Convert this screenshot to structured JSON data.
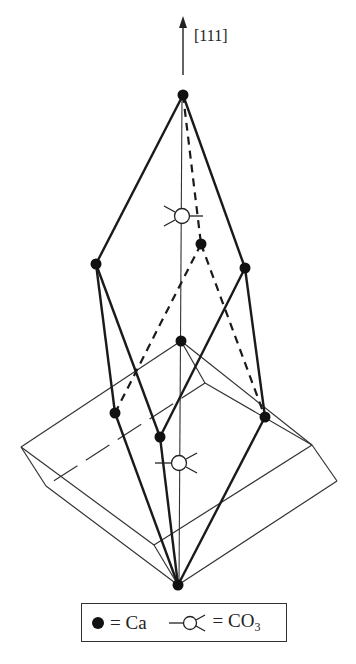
{
  "axis": {
    "label": "[111]"
  },
  "legend": {
    "ca_label": "= Ca",
    "co3_label_main": "= CO",
    "co3_label_sub": "3"
  },
  "symbols": {
    "ca": "filled-circle",
    "co3": "open-circle-with-three-arms"
  },
  "colors": {
    "line": "#222222",
    "thin_line": "#333333",
    "background": "#ffffff"
  },
  "ca_atoms": [
    {
      "id": "A",
      "x": 183,
      "y": 95
    },
    {
      "id": "B",
      "x": 96,
      "y": 264
    },
    {
      "id": "C",
      "x": 245,
      "y": 268
    },
    {
      "id": "D",
      "x": 201,
      "y": 244
    },
    {
      "id": "E",
      "x": 181,
      "y": 341
    },
    {
      "id": "F",
      "x": 115,
      "y": 413
    },
    {
      "id": "G",
      "x": 160,
      "y": 437
    },
    {
      "id": "H",
      "x": 265,
      "y": 417
    },
    {
      "id": "I",
      "x": 178,
      "y": 585
    }
  ],
  "co3_groups": [
    {
      "id": "upper",
      "x": 182,
      "y": 216
    },
    {
      "id": "lower",
      "x": 179,
      "y": 463
    }
  ]
}
